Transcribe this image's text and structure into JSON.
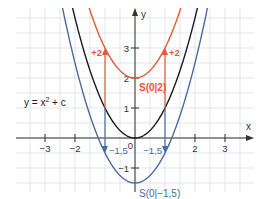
{
  "chart_data": {
    "type": "line",
    "title": "",
    "annotation_formula": "y = x² + c",
    "xlabel": "x",
    "ylabel": "y",
    "xlim": [
      -4,
      4
    ],
    "ylim": [
      -1.8,
      4.4
    ],
    "grid": true,
    "grid_step": 0.5,
    "x_ticks": [
      -3,
      -2,
      2,
      3
    ],
    "x_tick_labels": [
      "−3",
      "−2",
      "2",
      "3"
    ],
    "y_ticks": [
      -1,
      1,
      2,
      3
    ],
    "y_tick_labels": [
      "−1",
      "1",
      "2",
      "3"
    ],
    "origin_label": "0",
    "series": [
      {
        "name": "y = x²",
        "c": 0,
        "color": "#1a1a1a"
      },
      {
        "name": "y = x² + 2",
        "c": 2,
        "color": "#e8573a",
        "vertex_label": "S(0|2)"
      },
      {
        "name": "y = x² − 1,5",
        "c": -1.5,
        "color": "#4a6aa0",
        "vertex_label": "S(0|−1,5)"
      }
    ],
    "shift_arrows": [
      {
        "x": -1,
        "from": 1,
        "to": 3,
        "label": "+2",
        "color": "#e8573a"
      },
      {
        "x": 1,
        "from": 1,
        "to": 3,
        "label": "+2",
        "color": "#e8573a"
      },
      {
        "x": -1,
        "from": 1,
        "to": -0.5,
        "label": "−1,5",
        "color": "#4a6aa0"
      },
      {
        "x": 1,
        "from": 1,
        "to": -0.5,
        "label": "−1,5",
        "color": "#4a6aa0"
      }
    ]
  },
  "layout": {
    "origin_px": [
      135,
      138
    ],
    "unit_px": 30,
    "grid_box": [
      16,
      8,
      254,
      192
    ]
  }
}
